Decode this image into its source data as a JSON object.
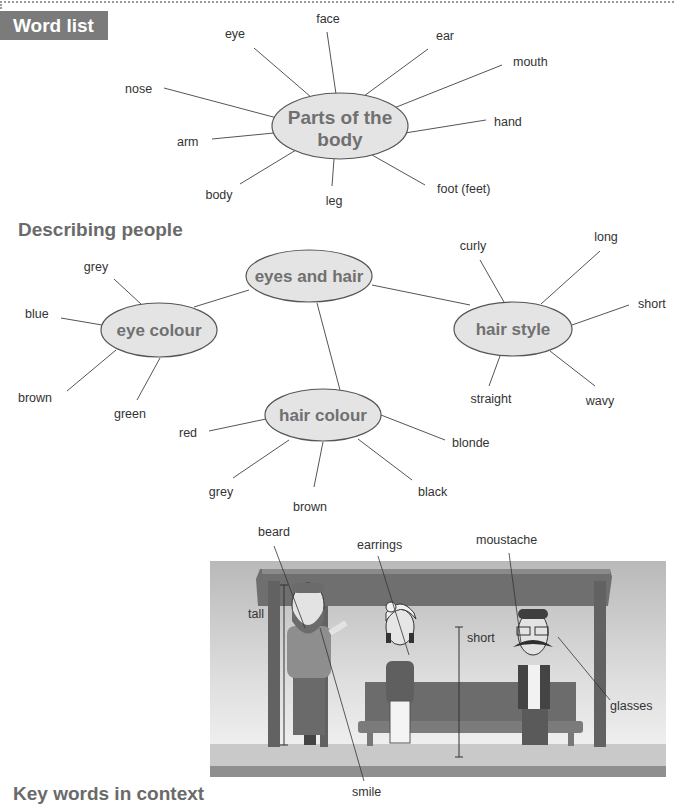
{
  "header": {
    "tag_label": "Word list"
  },
  "body_diagram": {
    "center": "Parts of the body",
    "center_lines": [
      "Parts of the",
      "body"
    ],
    "words": [
      "face",
      "eye",
      "ear",
      "mouth",
      "nose",
      "hand",
      "arm",
      "body",
      "leg",
      "foot (feet)"
    ]
  },
  "describing": {
    "title": "Describing people",
    "hub": "eyes and hair",
    "eye_colour": {
      "label": "eye colour",
      "words": [
        "grey",
        "blue",
        "brown",
        "green"
      ]
    },
    "hair_style": {
      "label": "hair style",
      "words": [
        "curly",
        "long",
        "short",
        "straight",
        "wavy"
      ]
    },
    "hair_colour": {
      "label": "hair colour",
      "words": [
        "red",
        "blonde",
        "grey",
        "brown",
        "black"
      ]
    }
  },
  "scene": {
    "labels": [
      "beard",
      "earrings",
      "moustache",
      "tall",
      "short",
      "glasses",
      "smile"
    ]
  },
  "footer": {
    "title": "Key words in context"
  },
  "colors": {
    "tag_bg": "#7b7b7b",
    "node_fill": "#e4e4e4",
    "node_stroke": "#555555",
    "heading": "#6a6a6a"
  }
}
